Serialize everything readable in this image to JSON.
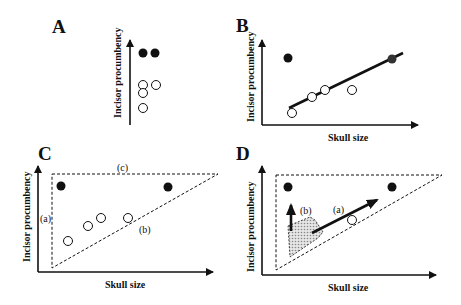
{
  "figure": {
    "panels": [
      {
        "id": "A",
        "letter": "A",
        "ylabel": "Incisor procumbency",
        "xlabel": "",
        "filled_points": [
          [
            143,
            53
          ],
          [
            155,
            53
          ]
        ],
        "open_points": [
          [
            143,
            85
          ],
          [
            156,
            85
          ],
          [
            143,
            93
          ],
          [
            143,
            108
          ]
        ]
      },
      {
        "id": "B",
        "letter": "B",
        "ylabel": "Incisor procumbency",
        "xlabel": "Skull size",
        "filled_points": [
          [
            288,
            58
          ],
          [
            392,
            59
          ]
        ],
        "open_points": [
          [
            292,
            113
          ],
          [
            312,
            97
          ],
          [
            325,
            90
          ],
          [
            352,
            90
          ]
        ],
        "regression_line": [
          [
            289,
            108
          ],
          [
            403,
            53
          ]
        ]
      },
      {
        "id": "C",
        "letter": "C",
        "ylabel": "Incisor procumbency",
        "xlabel": "Skull size",
        "filled_points": [
          [
            61,
            186
          ],
          [
            168,
            187
          ]
        ],
        "open_points": [
          [
            68,
            241
          ],
          [
            88,
            226
          ],
          [
            101,
            218
          ],
          [
            128,
            218
          ]
        ],
        "annotations": [
          {
            "text": "(c)",
            "x": 123,
            "y": 171
          },
          {
            "text": "(a)",
            "x": 42,
            "y": 220
          },
          {
            "text": "(b)",
            "x": 144,
            "y": 233
          }
        ]
      },
      {
        "id": "D",
        "letter": "D",
        "ylabel": "Incisor procumbency",
        "xlabel": "Skull size",
        "filled_points": [
          [
            288,
            187
          ],
          [
            392,
            187
          ]
        ],
        "open_points": [
          [
            352,
            220
          ]
        ],
        "annotations": [
          {
            "text": "(b)",
            "x": 300,
            "y": 213
          },
          {
            "text": "(a)",
            "x": 333,
            "y": 212
          }
        ]
      }
    ]
  },
  "colors": {
    "ink": "#111111",
    "shade": "#bdbdbd",
    "background": "#ffffff"
  }
}
